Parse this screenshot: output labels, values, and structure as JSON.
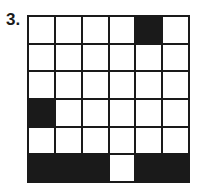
{
  "problem": {
    "number_label": "3.",
    "grid": {
      "rows": 6,
      "cols": 6,
      "cells": [
        [
          0,
          0,
          0,
          0,
          1,
          0
        ],
        [
          0,
          0,
          0,
          0,
          0,
          0
        ],
        [
          0,
          0,
          0,
          0,
          0,
          0
        ],
        [
          1,
          0,
          0,
          0,
          0,
          0
        ],
        [
          0,
          0,
          0,
          0,
          0,
          0
        ],
        [
          1,
          1,
          1,
          0,
          1,
          1
        ]
      ],
      "filled_color": "#1a1a1a",
      "empty_color": "#ffffff"
    }
  }
}
